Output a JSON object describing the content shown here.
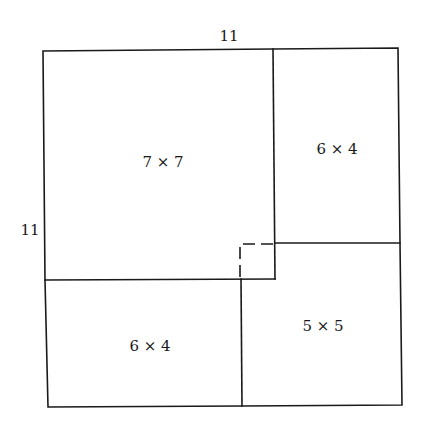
{
  "diagram": {
    "dimension_labels": {
      "top": "11",
      "left": "11"
    },
    "regions": [
      {
        "id": "square-7x7",
        "label": "7 × 7"
      },
      {
        "id": "rect-6x4-top-right",
        "label": "6 × 4"
      },
      {
        "id": "rect-6x4-bottom-left",
        "label": "6 × 4"
      },
      {
        "id": "square-5x5",
        "label": "5 × 5"
      }
    ],
    "overlap_marker": "dashed 1×1 square"
  }
}
